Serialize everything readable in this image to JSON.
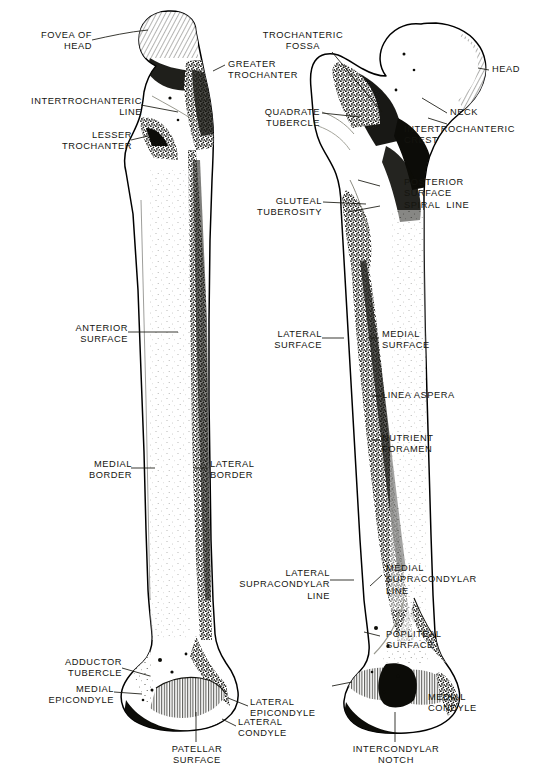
{
  "figure": {
    "views": [
      {
        "name": "anterior-view",
        "label": "Anterior surface view of right femur"
      },
      {
        "name": "posterior-view",
        "label": "Posterior surface view of right femur"
      }
    ],
    "style": {
      "background": "#ffffff",
      "ink": "#17170f",
      "bone_fill": "#ffffff"
    }
  },
  "labels": {
    "anterior": [
      {
        "id": "fovea-of-head",
        "text": "FOVEA OF\nHEAD"
      },
      {
        "id": "intertrochanteric-line",
        "text": "INTERTROCHANTERIC\nLINE"
      },
      {
        "id": "lesser-trochanter",
        "text": "LESSER\nTROCHANTER"
      },
      {
        "id": "greater-trochanter",
        "text": "GREATER\nTROCHANTER"
      },
      {
        "id": "anterior-surface",
        "text": "ANTERIOR\nSURFACE"
      },
      {
        "id": "medial-border",
        "text": "MEDIAL\nBORDER"
      },
      {
        "id": "lateral-border",
        "text": "LATERAL\nBORDER"
      },
      {
        "id": "adductor-tubercle",
        "text": "ADDUCTOR\nTUBERCLE"
      },
      {
        "id": "medial-epicondyle",
        "text": "MEDIAL\nEPICONDYLE"
      },
      {
        "id": "patellar-surface",
        "text": "PATELLAR\nSURFACE"
      },
      {
        "id": "lateral-epicondyle",
        "text": "LATERAL\nEPICONDYLE"
      },
      {
        "id": "lateral-condyle",
        "text": "LATERAL\nCONDYLE"
      }
    ],
    "posterior": [
      {
        "id": "trochanteric-fossa",
        "text": "TROCHANTERIC\nFOSSA"
      },
      {
        "id": "head",
        "text": "HEAD"
      },
      {
        "id": "neck",
        "text": "NECK"
      },
      {
        "id": "quadrate-tubercle",
        "text": "QUADRATE\nTUBERCLE"
      },
      {
        "id": "intertrochanteric-crest",
        "text": "INTERTROCHANTERIC\nCREST"
      },
      {
        "id": "posterior-surface",
        "text": "POSTERIOR\nSURFACE"
      },
      {
        "id": "gluteal-tuberosity",
        "text": "GLUTEAL\nTUBEROSITY"
      },
      {
        "id": "spiral-line",
        "text": "SPIRAL  LINE"
      },
      {
        "id": "lateral-surface",
        "text": "LATERAL\nSURFACE"
      },
      {
        "id": "medial-surface",
        "text": "MEDIAL\nSURFACE"
      },
      {
        "id": "linea-aspera",
        "text": "LINEA ASPERA"
      },
      {
        "id": "nutrient-foramen",
        "text": "NUTRIENT\nFORAMEN"
      },
      {
        "id": "lateral-supracondylar-line",
        "text": "LATERAL\nSUPRACONDYLAR\nLINE"
      },
      {
        "id": "medial-supracondylar-line",
        "text": "MEDIAL\nSUPRACONDYLAR\nLINE"
      },
      {
        "id": "popliteal-surface",
        "text": "POPLITEAL\nSURFACE"
      },
      {
        "id": "intercondylar-notch",
        "text": "INTERCONDYLAR\nNOTCH"
      },
      {
        "id": "medial-condyle",
        "text": "MEDIAL\nCONDYLE"
      }
    ]
  },
  "caption": {
    "text": ""
  }
}
